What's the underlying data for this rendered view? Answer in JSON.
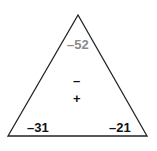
{
  "diagram": {
    "type": "fact-triangle",
    "top_value": "–52",
    "operations": [
      "–",
      "+"
    ],
    "bottom_left_value": "–31",
    "bottom_right_value": "–21",
    "colors": {
      "outline": "#222222",
      "top_value": "#8a8a8a",
      "bottom_values": "#111111",
      "operations": "#111111"
    }
  }
}
